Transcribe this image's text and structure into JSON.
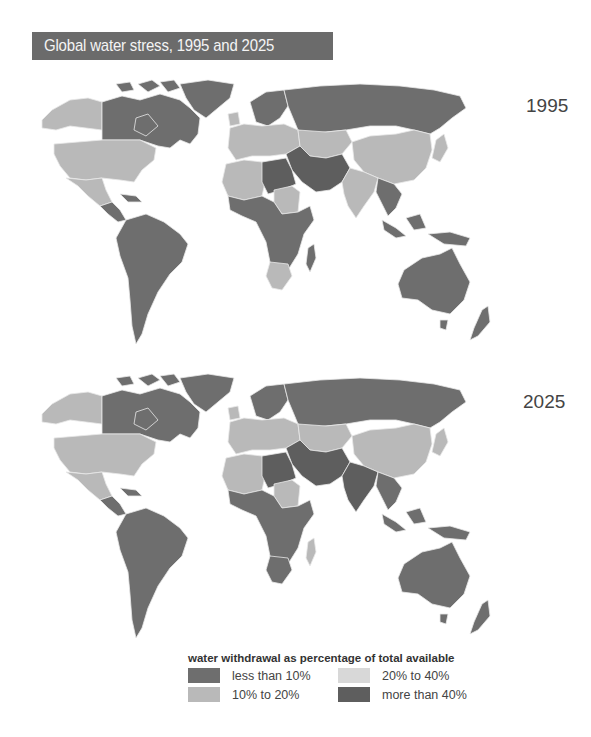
{
  "title": "Global water stress, 1995 and 2025",
  "colors": {
    "title_bg": "#6b6b6b",
    "less_than_10": "#6e6e6e",
    "10_to_20": "#b9b9b9",
    "20_to_40": "#d8d8d8",
    "more_than_40": "#5e5e5e",
    "border": "#e8e8e8"
  },
  "maps": [
    {
      "year": "1995",
      "regions": {
        "alaska": "10_to_20",
        "canada": "less_than_10",
        "greenland": "less_than_10",
        "usa": "10_to_20",
        "mexico": "10_to_20",
        "central_america": "less_than_10",
        "south_america": "less_than_10",
        "europe_north": "less_than_10",
        "europe_west": "10_to_20",
        "russia": "less_than_10",
        "central_asia": "10_to_20",
        "middle_east": "more_than_40",
        "north_africa_west": "10_to_20",
        "sahara": "more_than_40",
        "sudan": "10_to_20",
        "sub_saharan_africa": "less_than_10",
        "south_africa": "10_to_20",
        "madagascar": "less_than_10",
        "china": "10_to_20",
        "india": "10_to_20",
        "southeast_asia": "less_than_10",
        "japan": "10_to_20",
        "indonesia": "less_than_10",
        "australia": "less_than_10",
        "new_zealand": "less_than_10"
      }
    },
    {
      "year": "2025",
      "regions": {
        "alaska": "10_to_20",
        "canada": "less_than_10",
        "greenland": "less_than_10",
        "usa": "10_to_20",
        "mexico": "10_to_20",
        "central_america": "less_than_10",
        "south_america": "less_than_10",
        "europe_north": "less_than_10",
        "europe_west": "10_to_20",
        "russia": "less_than_10",
        "central_asia": "10_to_20",
        "middle_east": "more_than_40",
        "north_africa_west": "10_to_20",
        "sahara": "more_than_40",
        "sudan": "10_to_20",
        "sub_saharan_africa": "less_than_10",
        "south_africa": "less_than_10",
        "madagascar": "10_to_20",
        "china": "10_to_20",
        "india": "more_than_40",
        "southeast_asia": "less_than_10",
        "japan": "10_to_20",
        "indonesia": "less_than_10",
        "australia": "less_than_10",
        "new_zealand": "less_than_10"
      }
    }
  ],
  "legend": {
    "title": "water withdrawal as percentage of total available",
    "items": [
      {
        "key": "less_than_10",
        "label": "less than 10%"
      },
      {
        "key": "20_to_40",
        "label": "20% to 40%"
      },
      {
        "key": "10_to_20",
        "label": "10% to 20%"
      },
      {
        "key": "more_than_40",
        "label": "more than 40%"
      }
    ]
  }
}
